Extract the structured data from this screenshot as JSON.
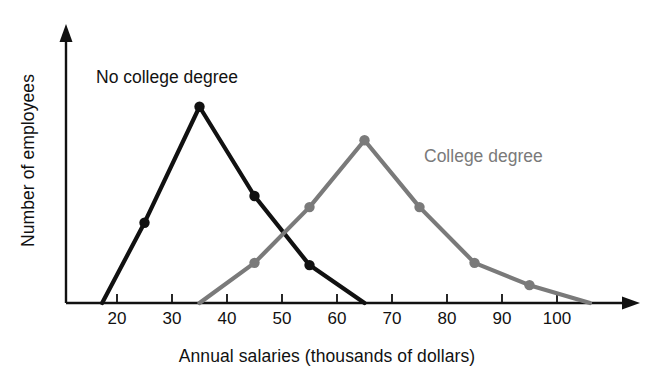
{
  "chart_data": {
    "type": "line",
    "title": "",
    "xlabel": "Annual salaries (thousands of dollars)",
    "ylabel": "Number of employees",
    "xlim": [
      10,
      112
    ],
    "ylim": [
      0,
      100
    ],
    "xticks": [
      20,
      30,
      40,
      50,
      60,
      70,
      80,
      90,
      100
    ],
    "xtick_labels": [
      "20",
      "30",
      "40",
      "50",
      "60",
      "70",
      "80",
      "90",
      "100"
    ],
    "yticks": [],
    "ytick_labels": [],
    "grid": false,
    "legend_position": "inline-annotation",
    "series": [
      {
        "name": "No college degree",
        "color": "#111111",
        "marker": "circle",
        "label_position": {
          "x": 96,
          "y": 67
        },
        "points": [
          {
            "x": 17.3,
            "y": 0,
            "marker": false
          },
          {
            "x": 25,
            "y": 36,
            "marker": true
          },
          {
            "x": 35,
            "y": 88,
            "marker": true
          },
          {
            "x": 45,
            "y": 48,
            "marker": true
          },
          {
            "x": 55,
            "y": 17,
            "marker": true
          },
          {
            "x": 65,
            "y": 0,
            "marker": false
          }
        ]
      },
      {
        "name": "College degree",
        "color": "#7a7a7a",
        "marker": "circle",
        "label_position": {
          "x": 424,
          "y": 146
        },
        "points": [
          {
            "x": 35,
            "y": 0,
            "marker": false
          },
          {
            "x": 45,
            "y": 18,
            "marker": true
          },
          {
            "x": 55,
            "y": 43,
            "marker": true
          },
          {
            "x": 65,
            "y": 73,
            "marker": true
          },
          {
            "x": 75,
            "y": 43,
            "marker": true
          },
          {
            "x": 85,
            "y": 18,
            "marker": true
          },
          {
            "x": 95,
            "y": 8,
            "marker": true
          },
          {
            "x": 106,
            "y": 0,
            "marker": false
          }
        ]
      }
    ],
    "annotations": [
      {
        "text": "No college degree",
        "color": "#121212"
      },
      {
        "text": "College degree",
        "color": "#7a7a7a"
      }
    ]
  },
  "axes": {
    "x_title": "Annual salaries (thousands of dollars)",
    "y_title": "Number of employees",
    "x_tick_labels": [
      "20",
      "30",
      "40",
      "50",
      "60",
      "70",
      "80",
      "90",
      "100"
    ],
    "x_axis_has_arrow": true,
    "y_axis_has_arrow": true,
    "axis_color": "#111111"
  },
  "labels": {
    "no_college": "No college degree",
    "college": "College degree"
  },
  "colors": {
    "no_college_line": "#111111",
    "college_line": "#7a7a7a",
    "axis": "#111111",
    "background": "#ffffff"
  }
}
